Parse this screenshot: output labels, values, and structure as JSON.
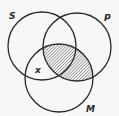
{
  "diagram": {
    "type": "venn",
    "circles": [
      {
        "label": "S",
        "cx": 42,
        "cy": 46,
        "r": 34
      },
      {
        "label": "P",
        "cx": 77,
        "cy": 47,
        "r": 34
      },
      {
        "label": "M",
        "cx": 59,
        "cy": 78,
        "r": 34
      }
    ],
    "labels": {
      "S": "S",
      "P": "P",
      "M": "M",
      "x": "x"
    },
    "shaded_region": "P ∩ M",
    "x_marker_region": "S ∩ M, outside P",
    "colors": {
      "stroke": "#2a2a2a",
      "hatch": "#555555",
      "background": "#f7f7f5"
    }
  }
}
